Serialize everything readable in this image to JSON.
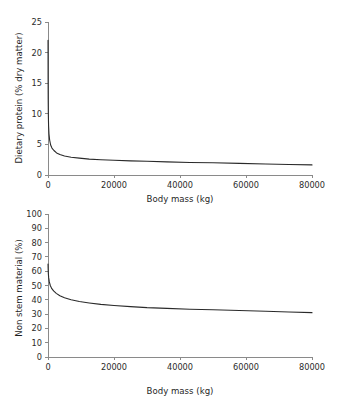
{
  "figure": {
    "background_color": "#ffffff",
    "curve_color": "#2a2a2a",
    "axis_color": "#8a8a8a"
  },
  "chart_data": [
    {
      "type": "line",
      "panel": "top",
      "title": "",
      "xlabel": "Body mass (kg)",
      "ylabel": "Dietary protein (% dry matter)",
      "xlim": [
        0,
        80000
      ],
      "ylim": [
        0,
        25
      ],
      "xticks": [
        0,
        20000,
        40000,
        60000,
        80000
      ],
      "xtick_labels": [
        "0",
        "20000",
        "40000",
        "60000",
        "80000"
      ],
      "yticks": [
        0,
        5,
        10,
        15,
        20,
        25
      ],
      "ytick_labels": [
        "0",
        "5",
        "10",
        "15",
        "20",
        "25"
      ],
      "grid": false,
      "legend": false,
      "series": [
        {
          "name": "Dietary protein requirement",
          "x": [
            10,
            30,
            60,
            100,
            180,
            300,
            500,
            800,
            1200,
            1800,
            2600,
            3600,
            5000,
            7000,
            9500,
            12500,
            16000,
            20000,
            25000,
            30000,
            36000,
            43000,
            50000,
            58000,
            66000,
            73000,
            80000
          ],
          "values": [
            22.0,
            15.6,
            12.2,
            9.9,
            8.0,
            6.7,
            5.7,
            4.9,
            4.4,
            4.0,
            3.6,
            3.35,
            3.1,
            2.9,
            2.75,
            2.6,
            2.5,
            2.4,
            2.3,
            2.25,
            2.15,
            2.05,
            2.0,
            1.9,
            1.8,
            1.72,
            1.65
          ]
        }
      ]
    },
    {
      "type": "line",
      "panel": "bottom",
      "title": "",
      "xlabel": "Body mass (kg)",
      "ylabel": "Non stem material (%)",
      "xlim": [
        0,
        80000
      ],
      "ylim": [
        0,
        100
      ],
      "xticks": [
        0,
        20000,
        40000,
        60000,
        80000
      ],
      "xtick_labels": [
        "0",
        "20000",
        "40000",
        "60000",
        "80000"
      ],
      "yticks": [
        0,
        10,
        20,
        30,
        40,
        50,
        60,
        70,
        80,
        90,
        100
      ],
      "ytick_labels": [
        "0",
        "10",
        "20",
        "30",
        "40",
        "50",
        "60",
        "70",
        "80",
        "90",
        "100"
      ],
      "grid": false,
      "legend": false,
      "series": [
        {
          "name": "Non stem material requirement",
          "x": [
            10,
            40,
            100,
            200,
            400,
            700,
            1100,
            1700,
            2500,
            3600,
            5000,
            7000,
            9500,
            12500,
            16000,
            20000,
            25000,
            30000,
            36000,
            43000,
            50000,
            58000,
            66000,
            73000,
            80000
          ],
          "values": [
            65.0,
            62.0,
            58.5,
            55.5,
            52.5,
            50.0,
            48.0,
            46.2,
            44.5,
            42.8,
            41.4,
            40.0,
            38.8,
            37.8,
            36.8,
            36.0,
            35.2,
            34.5,
            34.0,
            33.4,
            33.0,
            32.5,
            32.0,
            31.5,
            31.0
          ]
        }
      ]
    }
  ]
}
